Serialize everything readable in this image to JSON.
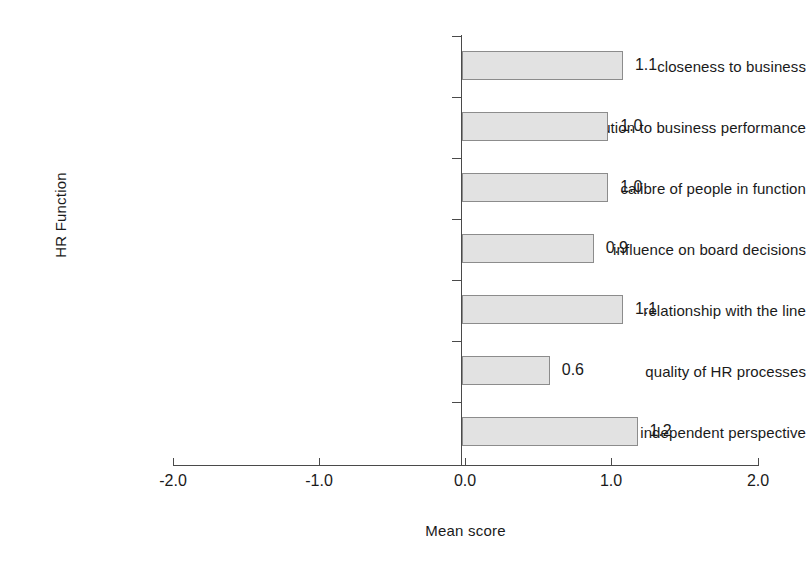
{
  "chart_data": {
    "type": "bar",
    "orientation": "horizontal",
    "title": "",
    "xlabel": "Mean score",
    "ylabel": "HR Function",
    "categories": [
      "closeness to business",
      "contribution to business performance",
      "calibre of people in function",
      "influence on board decisions",
      "relationship with the line",
      "quality of HR processes",
      "ability to offer independent perspective"
    ],
    "values": [
      1.1,
      1.0,
      1.0,
      0.9,
      1.1,
      0.6,
      1.2
    ],
    "value_labels": [
      "1.1",
      "1.0",
      "1.0",
      "0.9",
      "1.1",
      "0.6",
      "1.2"
    ],
    "xlim": [
      -2.0,
      2.0
    ],
    "xticks": [
      -2.0,
      -1.0,
      0.0,
      1.0,
      2.0
    ],
    "xtick_labels": [
      "-2.0",
      "-1.0",
      "0.0",
      "1.0",
      "2.0"
    ],
    "grid": false,
    "legend": null,
    "bar_fill_color": "#e2e2e2",
    "bar_border_color": "#8c8c8c",
    "axis_color": "#4a4a4a",
    "text_color": "#1a1a1a",
    "background_color": "#ffffff"
  }
}
